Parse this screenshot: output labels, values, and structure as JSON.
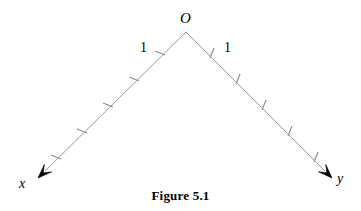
{
  "figure": {
    "caption": "Figure 5.1",
    "background_color": "#ffffff",
    "ink_color": "#000000",
    "ray_color": "#9a9a9a",
    "tick_color": "#8a8a8a",
    "width": 361,
    "height": 211
  },
  "labels": {
    "origin": "O",
    "axis_x": "x",
    "axis_y": "y",
    "unit_left": "1",
    "unit_right": "1"
  },
  "chart_data": {
    "type": "diagram",
    "title": "Figure 5.1",
    "vertex": {
      "label": "O",
      "x": 186,
      "y": 32
    },
    "rays": [
      {
        "name": "x-axis-ray",
        "label": "x",
        "label_position": {
          "x": 22,
          "y": 184
        },
        "start": {
          "x": 186,
          "y": 32
        },
        "end": {
          "x": 38,
          "y": 178
        },
        "arrow_at": "end",
        "tick_count": 5,
        "tick_spacing_px": 26,
        "first_tick_label": "1",
        "first_tick": {
          "x": 160,
          "y": 53
        },
        "ticks": [
          {
            "index": 1,
            "value": 1,
            "x": 160,
            "y": 53
          },
          {
            "index": 2,
            "value": 2,
            "x": 134,
            "y": 79
          },
          {
            "index": 3,
            "value": 3,
            "x": 108,
            "y": 105
          },
          {
            "index": 4,
            "value": 4,
            "x": 82,
            "y": 131
          },
          {
            "index": 5,
            "value": 5,
            "x": 56,
            "y": 157
          }
        ]
      },
      {
        "name": "y-axis-ray",
        "label": "y",
        "label_position": {
          "x": 340,
          "y": 180
        },
        "start": {
          "x": 186,
          "y": 32
        },
        "end": {
          "x": 332,
          "y": 178
        },
        "arrow_at": "end",
        "tick_count": 5,
        "tick_spacing_px": 26,
        "first_tick_label": "1",
        "first_tick": {
          "x": 212,
          "y": 53
        },
        "ticks": [
          {
            "index": 1,
            "value": 1,
            "x": 212,
            "y": 53
          },
          {
            "index": 2,
            "value": 2,
            "x": 238,
            "y": 79
          },
          {
            "index": 3,
            "value": 3,
            "x": 264,
            "y": 105
          },
          {
            "index": 4,
            "value": 4,
            "x": 290,
            "y": 131
          },
          {
            "index": 5,
            "value": 5,
            "x": 316,
            "y": 157
          }
        ]
      }
    ],
    "xlabel": "",
    "ylabel": "",
    "grid": false,
    "legend": false
  }
}
